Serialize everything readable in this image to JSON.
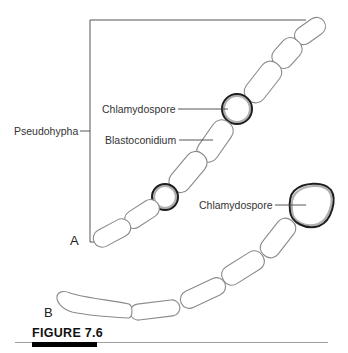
{
  "figure": {
    "caption_label": "FIGURE 7.6",
    "panels": {
      "a": {
        "label": "A",
        "annotations": {
          "pseudohypha": "Pseudohypha",
          "chlamydospore": "Chlamydospore",
          "blastoconidium": "Blastoconidium"
        }
      },
      "b": {
        "label": "B",
        "annotations": {
          "chlamydospore": "Chlamydospore"
        }
      }
    }
  },
  "colors": {
    "cell_outline": "#8a8a8a",
    "spore_outline": "#1e1e1e",
    "caption_bar": "#000000"
  }
}
